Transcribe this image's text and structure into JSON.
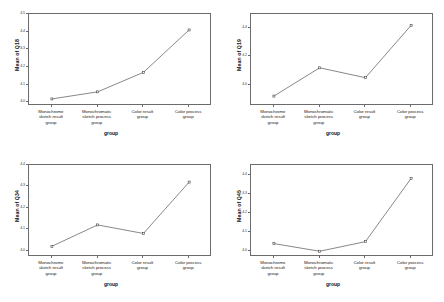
{
  "figure": {
    "panel_count": 4,
    "line_color": "#555555",
    "axis_color": "#6b6b6b",
    "marker_color": "#444444",
    "background": "#ffffff"
  },
  "categories": [
    "Monochrome sketch result group",
    "Monochromatic sketch process group",
    "Color result group",
    "Color process group"
  ],
  "category_lines": [
    [
      "Monochrome",
      "sketch result",
      "group"
    ],
    [
      "Monochromatic",
      "sketch process",
      "group"
    ],
    [
      "Color result",
      "group"
    ],
    [
      "Color process",
      "group"
    ]
  ],
  "xlabel": "group",
  "chart_data": [
    {
      "type": "line",
      "panel": "top-left",
      "title": "",
      "ylabel": "Mean of Q18",
      "xlabel": "group",
      "categories": [
        "Monochrome sketch result group",
        "Monochromatic sketch process group",
        "Color result group",
        "Color process group"
      ],
      "values": [
        4.02,
        4.06,
        4.17,
        4.41
      ],
      "ylim": [
        3.98,
        4.5
      ],
      "yticks": [
        4.0,
        4.1,
        4.2,
        4.3,
        4.4,
        4.5
      ],
      "ytick_labels": [
        "4.0",
        "4.1",
        "4.2",
        "4.3",
        "4.4",
        "4.5"
      ],
      "grid": false,
      "legend": "none",
      "markers": true
    },
    {
      "type": "line",
      "panel": "top-right",
      "title": "",
      "ylabel": "Mean of Q19",
      "xlabel": "group",
      "categories": [
        "Monochrome sketch result group",
        "Monochromatic sketch process group",
        "Color result group",
        "Color process group"
      ],
      "values": [
        3.92,
        4.12,
        4.05,
        4.42
      ],
      "ylim": [
        3.85,
        4.5
      ],
      "yticks": [
        4.0,
        4.2,
        4.4
      ],
      "ytick_labels": [
        "4.0",
        "4.2",
        "4.4"
      ],
      "grid": false,
      "legend": "none",
      "markers": true
    },
    {
      "type": "line",
      "panel": "bottom-left",
      "title": "",
      "ylabel": "Mean of Q34",
      "xlabel": "group",
      "categories": [
        "Monochrome sketch result group",
        "Monochromatic sketch process group",
        "Color result group",
        "Color process group"
      ],
      "values": [
        4.02,
        4.12,
        4.08,
        4.32
      ],
      "ylim": [
        3.97,
        4.4
      ],
      "yticks": [
        4.0,
        4.1,
        4.2,
        4.3,
        4.4
      ],
      "ytick_labels": [
        "4.0",
        "4.1",
        "4.2",
        "4.3",
        "4.4"
      ],
      "grid": false,
      "legend": "none",
      "markers": true
    },
    {
      "type": "line",
      "panel": "bottom-right",
      "title": "",
      "ylabel": "Mean of Q45",
      "xlabel": "group",
      "categories": [
        "Monochrome sketch result group",
        "Monochromatic sketch process group",
        "Color result group",
        "Color process group"
      ],
      "values": [
        4.04,
        4.0,
        4.05,
        4.38
      ],
      "ylim": [
        3.97,
        4.45
      ],
      "yticks": [
        4.0,
        4.1,
        4.2,
        4.3,
        4.4
      ],
      "ytick_labels": [
        "4.0",
        "4.1",
        "4.2",
        "4.3",
        "4.4"
      ],
      "grid": false,
      "legend": "none",
      "markers": true
    }
  ]
}
